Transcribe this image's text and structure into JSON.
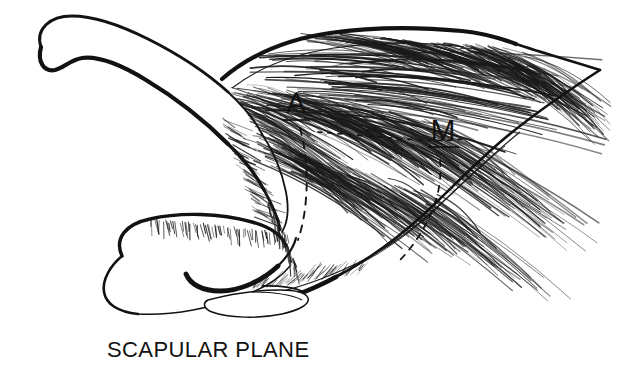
{
  "figure": {
    "name": "scapular-plane-anatomical-line-drawing",
    "background_color": "#ffffff",
    "ink_color": "#121212",
    "caption": "SCAPULAR PLANE",
    "caption_font_size": 22,
    "width": 626,
    "height": 372
  },
  "labels": [
    {
      "id": "A",
      "text": "A",
      "meaning": "anterior-deltoid-segment",
      "x": 296,
      "y": 113,
      "font_size": 30,
      "underlined": true,
      "underline_x1": 283,
      "underline_x2": 310,
      "underline_y": 120
    },
    {
      "id": "M",
      "text": "M",
      "meaning": "middle-deltoid-segment",
      "x": 443,
      "y": 140,
      "font_size": 30,
      "underlined": true,
      "underline_x1": 428,
      "underline_x2": 459,
      "underline_y": 147
    }
  ],
  "caption_position": {
    "x": 107,
    "y": 357
  },
  "structures": [
    {
      "name": "coracoid-process",
      "description": "hooked bone process, upper left, thick outline"
    },
    {
      "name": "clavicle-acromion-shaft",
      "description": "curved bone shaft descending from coracoid hook"
    },
    {
      "name": "humeral-head",
      "description": "rounded bone mass, lower left center"
    },
    {
      "name": "glenoid-lens",
      "description": "thin lens-shaped structure at bottom center"
    },
    {
      "name": "deltoid-muscle-belly",
      "description": "large fan-shaped muscle with fiber striations, right two thirds"
    },
    {
      "name": "segment-divider-dashed-anterior",
      "description": "dashed line separating anterior from middle deltoid"
    },
    {
      "name": "segment-divider-dashed-middle",
      "description": "dashed line separating middle from posterior deltoid"
    }
  ]
}
